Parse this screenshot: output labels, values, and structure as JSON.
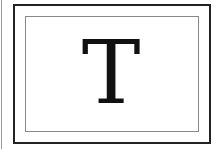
{
  "glyph": {
    "character": "T",
    "color": "#111111"
  },
  "frame": {
    "outer_border_color": "#222222",
    "inner_border_color": "#888888"
  }
}
